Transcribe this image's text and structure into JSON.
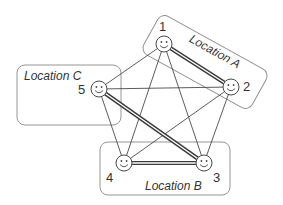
{
  "diagram": {
    "locations": [
      {
        "id": "A",
        "label": "Location A"
      },
      {
        "id": "B",
        "label": "Location B"
      },
      {
        "id": "C",
        "label": "Location C"
      }
    ],
    "nodes": [
      {
        "id": "1",
        "label": "1",
        "location": "A"
      },
      {
        "id": "2",
        "label": "2",
        "location": "A"
      },
      {
        "id": "3",
        "label": "3",
        "location": "B"
      },
      {
        "id": "4",
        "label": "4",
        "location": "B"
      },
      {
        "id": "5",
        "label": "5",
        "location": "C"
      }
    ],
    "edges": [
      {
        "from": "1",
        "to": "2",
        "style": "double"
      },
      {
        "from": "5",
        "to": "3",
        "style": "double"
      },
      {
        "from": "4",
        "to": "3",
        "style": "double"
      },
      {
        "from": "1",
        "to": "3",
        "style": "single"
      },
      {
        "from": "1",
        "to": "4",
        "style": "single"
      },
      {
        "from": "1",
        "to": "5",
        "style": "single"
      },
      {
        "from": "2",
        "to": "3",
        "style": "single"
      },
      {
        "from": "2",
        "to": "4",
        "style": "single"
      },
      {
        "from": "2",
        "to": "5",
        "style": "single"
      },
      {
        "from": "5",
        "to": "4",
        "style": "single"
      }
    ],
    "icon": "smiley-face-icon"
  }
}
